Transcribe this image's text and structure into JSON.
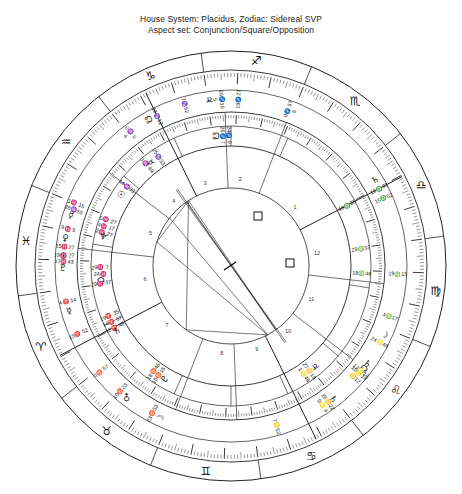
{
  "header": {
    "line1": "House System: Placidus, Zodiac: Sidereal SVP",
    "line2": "Aspect set: Conjunction/Square/Opposition"
  },
  "chart_data": {
    "type": "scatter",
    "title": "House System: Placidus, Zodiac: Sidereal SVP",
    "subtitle": "Aspect set: Conjunction/Square/Opposition",
    "chart_kind": "astrological-biwheel",
    "house_system": "Placidus",
    "zodiac": "Sidereal SVP",
    "aspect_set": [
      "Conjunction",
      "Square",
      "Opposition"
    ],
    "zodiac_ring_signs": [
      {
        "name": "Aries",
        "glyph": "♈"
      },
      {
        "name": "Taurus",
        "glyph": "♉"
      },
      {
        "name": "Gemini",
        "glyph": "♊"
      },
      {
        "name": "Cancer",
        "glyph": "♋"
      },
      {
        "name": "Leo",
        "glyph": "♌"
      },
      {
        "name": "Virgo",
        "glyph": "♍"
      },
      {
        "name": "Libra",
        "glyph": "♎"
      },
      {
        "name": "Scorpio",
        "glyph": "♏"
      },
      {
        "name": "Sagittarius",
        "glyph": "♐"
      },
      {
        "name": "Capricorn",
        "glyph": "♑"
      },
      {
        "name": "Aquarius",
        "glyph": "♒"
      },
      {
        "name": "Pisces",
        "glyph": "♓"
      }
    ],
    "house_numbers": [
      "1",
      "2",
      "3",
      "4",
      "5",
      "6",
      "7",
      "8",
      "9",
      "10",
      "11",
      "12"
    ],
    "outer_ring_labels": [
      {
        "text": "26♋22",
        "sub": "0♌ 4",
        "glyph": "♄",
        "lon": 116.4
      },
      {
        "text": "10♌18",
        "sub": "♋12",
        "glyph": "☊",
        "lon": 131.0
      },
      {
        "text": "7♋52",
        "glyph": "",
        "lon": 97.9
      },
      {
        "text": "19♓ 27",
        "sub": "17♓43",
        "glyph": "♇",
        "lon": 349.4
      },
      {
        "text": "0♉ 57",
        "glyph": "",
        "lon": 30.9
      },
      {
        "text": "23♉53",
        "glyph": "☽",
        "lon": 53.9
      },
      {
        "text": "10♉23",
        "glyph": "♂",
        "lon": 40.4
      },
      {
        "text": "15♈ 52",
        "glyph": "",
        "lon": 15.9
      },
      {
        "text": "4♈ 14",
        "glyph": "☿",
        "lon": 4.2
      },
      {
        "text": "15♓27",
        "glyph": "☉",
        "lon": 345.4
      },
      {
        "text": "9♓ 5",
        "glyph": "♀",
        "lon": 339.1
      },
      {
        "text": "1♓ 15",
        "sub": "28♒55",
        "glyph": "☿",
        "lon": 331.2
      },
      {
        "text": "0♒ 0",
        "sub": "4",
        "glyph": "",
        "lon": 300.0
      },
      {
        "text": "18♑12",
        "glyph": "☊",
        "lon": 288.2
      },
      {
        "text": "7♑52",
        "glyph": "",
        "lon": 277.9
      },
      {
        "text": "26♐16",
        "sub": "5",
        "glyph": "♃",
        "lon": 266.3
      },
      {
        "text": "19♐27",
        "glyph": "",
        "lon": 259.5
      },
      {
        "text": "0♐ 57",
        "sub": "6",
        "glyph": "",
        "lon": 240.9
      },
      {
        "text": "15♎52",
        "glyph": "",
        "lon": 195.9
      },
      {
        "text": "19♎33",
        "glyph": "♄",
        "lon": 199.6
      },
      {
        "text": "19♍15",
        "glyph": "",
        "lon": 169.3
      },
      {
        "text": "24♌48",
        "glyph": "☽",
        "lon": 144.8
      },
      {
        "text": "13♌14",
        "glyph": "♄",
        "lon": 133.2
      },
      {
        "text": "4♍17",
        "glyph": "",
        "lon": 154.3
      }
    ],
    "inner_ring_labels": [
      {
        "text": "27♋18",
        "sub": "1♌49",
        "glyph": "♃",
        "lon": 117.3
      },
      {
        "text": "29♓ 7",
        "sub": "24♓",
        "glyph": "☊",
        "lon": 354.0
      },
      {
        "text": "18♉46",
        "sub": "15♉15",
        "glyph": "♇",
        "lon": 47.0
      },
      {
        "text": "19♈ 35",
        "sub": "14♈ 57",
        "sub2": "12♈ 48",
        "glyph": "♄",
        "lon": 17.0
      },
      {
        "text": "29♓ 37",
        "glyph": "",
        "lon": 359.6
      },
      {
        "text": "5♓ 27",
        "sub": "4♓ 17",
        "sub2": "2♓ 27",
        "glyph": "♆",
        "lon": 334.5
      },
      {
        "text": "14♒33",
        "glyph": "☉",
        "lon": 314.5
      },
      {
        "text": "1♒ 49",
        "glyph": "",
        "lon": 301.8
      },
      {
        "text": "25♑33",
        "glyph": "☿",
        "lon": 295.5
      },
      {
        "text": "24♐ 9",
        "sub": "26♐ 7",
        "glyph": "☊",
        "lon": 264.2
      },
      {
        "text": "18♍46",
        "glyph": "",
        "lon": 168.8
      },
      {
        "text": "29♍37",
        "glyph": "",
        "lon": 179.6
      },
      {
        "text": "19♎35",
        "glyph": "",
        "lon": 199.6
      }
    ],
    "planets": [
      {
        "name": "Sun",
        "glyph": "☉",
        "position": "15♓27"
      },
      {
        "name": "Moon",
        "glyph": "☽",
        "position": "23♉53"
      },
      {
        "name": "Mercury",
        "glyph": "☿",
        "position": "1♓15"
      },
      {
        "name": "Venus",
        "glyph": "♀",
        "position": "9♓5"
      },
      {
        "name": "Mars",
        "glyph": "♂",
        "position": "10♉23"
      },
      {
        "name": "Jupiter",
        "glyph": "♃",
        "position": "26♐16"
      },
      {
        "name": "Saturn",
        "glyph": "♄",
        "position": "19♎33"
      },
      {
        "name": "Uranus",
        "glyph": "♅",
        "position": "19♓27"
      },
      {
        "name": "Neptune",
        "glyph": "♆",
        "position": "5♓27"
      },
      {
        "name": "Pluto",
        "glyph": "♇",
        "position": "18♉46"
      },
      {
        "name": "North Node",
        "glyph": "☊",
        "position": "10♌18"
      }
    ],
    "aspect_markers": [
      {
        "type": "square",
        "glyph": "□"
      },
      {
        "type": "square",
        "glyph": "□"
      }
    ],
    "ring_count": 4,
    "grid": false,
    "legend": "none"
  }
}
